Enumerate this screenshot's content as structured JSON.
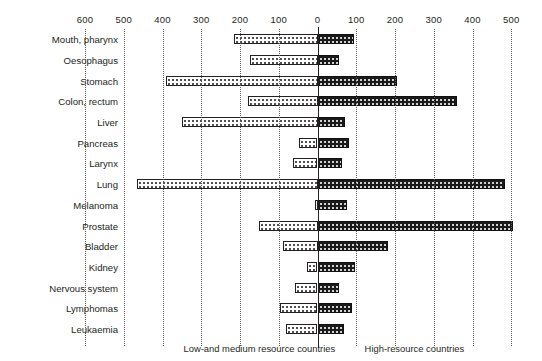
{
  "chart_data": {
    "type": "bar",
    "orientation": "horizontal",
    "subtype": "bidirectional population pyramid",
    "title": "",
    "xlabel": "",
    "ylabel": "",
    "grid": true,
    "legend_position": "bottom",
    "axis": {
      "zero_value": 0,
      "left_max": 600,
      "right_max": 500,
      "tick_step": 100,
      "tick_labels": [
        "600",
        "500",
        "400",
        "300",
        "200",
        "100",
        "0",
        "100",
        "200",
        "300",
        "400",
        "500"
      ],
      "tick_values": [
        -600,
        -500,
        -400,
        -300,
        -200,
        -100,
        0,
        100,
        200,
        300,
        400,
        500
      ]
    },
    "categories": [
      "Mouth, pharynx",
      "Oesophagus",
      "Stomach",
      "Colon, rectum",
      "Liver",
      "Pancreas",
      "Larynx",
      "Lung",
      "Melanoma",
      "Prostate",
      "Bladder",
      "Kidney",
      "Nervous system",
      "Lymphomas",
      "Leukaemia"
    ],
    "series": [
      {
        "name": "Low-and medium resource countries",
        "side": "left",
        "fill": "white-dotted",
        "values": [
          215,
          175,
          390,
          180,
          350,
          47,
          62,
          465,
          5,
          150,
          90,
          27,
          58,
          97,
          82
        ]
      },
      {
        "name": "High-resource countries",
        "side": "right",
        "fill": "black-speckled",
        "values": [
          95,
          55,
          205,
          360,
          72,
          80,
          62,
          485,
          75,
          505,
          183,
          98,
          55,
          90,
          68
        ]
      }
    ]
  },
  "footer": {
    "left_caption": "Low-and medium resource countries",
    "right_caption": "High-resource countries"
  }
}
